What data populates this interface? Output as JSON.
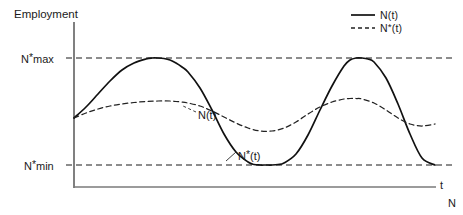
{
  "chart_data": {
    "type": "line",
    "title": "",
    "ylabel": "Employment",
    "xlabel": "t",
    "secondary_axis_label": "N",
    "ytick_labels": [
      "N*max",
      "N*min"
    ],
    "ytick_values": [
      58,
      165
    ],
    "grid": false,
    "gridlines": [
      {
        "label": "N*max",
        "style": "dashed",
        "y": 58
      },
      {
        "label": "N*min",
        "style": "dashed",
        "y": 165
      }
    ],
    "legend_position": "top-right",
    "annotations": [
      {
        "text": "N(t)",
        "x": 198,
        "y": 110
      },
      {
        "text": "N*(t)",
        "x": 238,
        "y": 150
      }
    ],
    "xlim": [
      74,
      435
    ],
    "ylim": [
      186,
      20
    ],
    "series": [
      {
        "name": "N(t)",
        "style": "solid",
        "color": "#111111",
        "description": "Large-amplitude oscillation of actual employment between N*min and N*max over two cycles",
        "x": [
          74,
          86,
          98,
          110,
          122,
          134,
          146,
          152,
          158,
          164,
          170,
          176,
          182,
          188,
          200,
          212,
          224,
          236,
          248,
          254,
          260,
          266,
          272,
          278,
          284,
          296,
          308,
          320,
          332,
          344,
          350,
          356,
          362,
          368,
          374,
          386,
          398,
          410,
          422,
          435
        ],
        "y": [
          118,
          107,
          94,
          81,
          70,
          63,
          59,
          58,
          58,
          58.5,
          60,
          63,
          67,
          72,
          88,
          110,
          134,
          152,
          162,
          164.5,
          165,
          165,
          165,
          164.5,
          163,
          154,
          135,
          110,
          86,
          66,
          60,
          58,
          58,
          59,
          62,
          78,
          104,
          134,
          158,
          165
        ]
      },
      {
        "name": "N*(t)",
        "style": "dashed",
        "color": "#222222",
        "description": "Small-amplitude oscillation of desired employment, damped around the midrange",
        "x": [
          74,
          86,
          98,
          110,
          122,
          134,
          146,
          158,
          170,
          176,
          182,
          188,
          200,
          212,
          224,
          236,
          248,
          260,
          272,
          284,
          296,
          308,
          320,
          332,
          344,
          350,
          356,
          362,
          374,
          386,
          398,
          410,
          422,
          435
        ],
        "y": [
          118,
          113,
          109,
          106,
          104,
          102.5,
          101.5,
          101,
          101,
          101.5,
          102,
          103,
          106,
          111,
          117,
          123,
          128,
          131,
          131,
          128,
          122,
          114,
          107,
          102,
          99,
          98.5,
          98.5,
          99,
          103,
          110,
          118,
          124,
          126,
          124
        ]
      }
    ]
  },
  "legend": {
    "items": [
      {
        "label_prefix": "N",
        "label_star": "",
        "label_suffix": "(t)",
        "style": "solid"
      },
      {
        "label_prefix": "N",
        "label_star": "*",
        "label_suffix": "(t)",
        "style": "dashed"
      }
    ]
  },
  "labels": {
    "y_axis_title": "Employment",
    "tick_max_prefix": "N",
    "tick_max_star": "*",
    "tick_max_suffix": "max",
    "tick_min_prefix": "N",
    "tick_min_star": "*",
    "tick_min_suffix": "min",
    "x_axis_title": "t",
    "n_axis_title": "N",
    "annot_actual": "N(t)",
    "annot_desired_prefix": "N",
    "annot_desired_star": "*",
    "annot_desired_suffix": "(t)"
  },
  "colors": {
    "line": "#111111",
    "dashed": "#222222",
    "axis": "#4a4a4a",
    "text": "#1a1a1a",
    "background": "#ffffff"
  }
}
